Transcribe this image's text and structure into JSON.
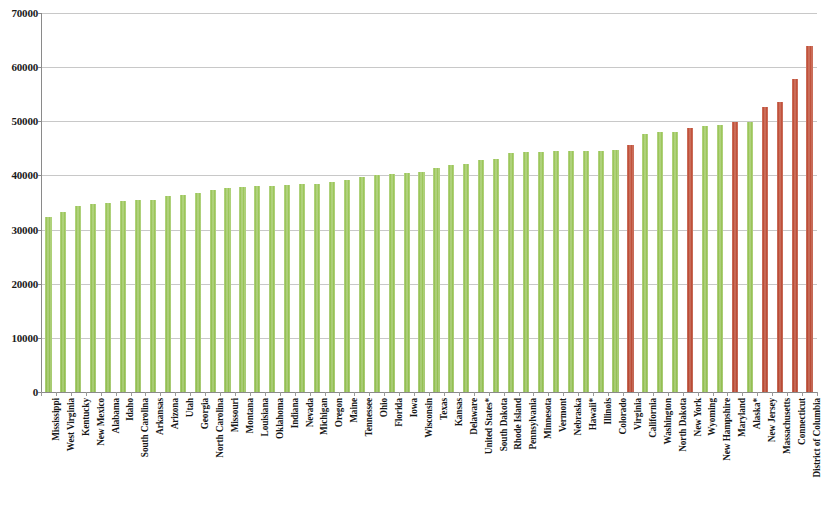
{
  "chart_data": {
    "type": "bar",
    "title": "",
    "subtitle": "",
    "xlabel": "",
    "ylabel": "",
    "ylim": [
      0,
      70000
    ],
    "y_ticks": [
      0,
      10000,
      20000,
      30000,
      40000,
      50000,
      60000,
      70000
    ],
    "grid": true,
    "legend": "none",
    "colors": {
      "default_bar": "#9dc75c",
      "highlight_bar": "#c2533c",
      "gridline": "#c8c8c8",
      "axis": "#8a8a8a",
      "text": "#161616",
      "background": "#ffffff"
    },
    "highlight_note": "Red bars mark highlighted jurisdictions; green bars are all others.",
    "categories": [
      "Mississippi",
      "West Virginia",
      "Kentucky",
      "New Mexico",
      "Alabama",
      "Idaho",
      "South Carolina",
      "Arkansas",
      "Arizona",
      "Utah",
      "Georgia",
      "North Carolina",
      "Missouri",
      "Montana",
      "Louisiana",
      "Oklahoma",
      "Indiana",
      "Nevada",
      "Michigan",
      "Oregon",
      "Maine",
      "Tennessee",
      "Ohio",
      "Florida",
      "Iowa",
      "Wisconsin",
      "Texas",
      "Kansas",
      "Delaware",
      "United States*",
      "South Dakota",
      "Rhode Island",
      "Pennsylvania",
      "Minnesota",
      "Vermont",
      "Nebraska",
      "Hawaii*",
      "Illinois",
      "Colorado",
      "Virginia",
      "California",
      "Washington",
      "North Dakota",
      "New York",
      "Wyoming",
      "New Hampshire",
      "Maryland",
      "Alaska*",
      "New Jersey",
      "Massachusetts",
      "Connecticut",
      "District of Columbia"
    ],
    "values": [
      32400,
      33200,
      34300,
      34800,
      35000,
      35200,
      35400,
      35500,
      36200,
      36300,
      36800,
      37400,
      37600,
      37800,
      38000,
      38100,
      38200,
      38400,
      38400,
      38800,
      39100,
      39700,
      40000,
      40300,
      40400,
      40700,
      41300,
      42000,
      42200,
      42800,
      43100,
      44100,
      44300,
      44400,
      44500,
      44500,
      44500,
      44500,
      44700,
      45700,
      47600,
      48000,
      48100,
      48800,
      49200,
      49300,
      49800,
      49900,
      52700,
      53500,
      57800,
      63900
    ],
    "highlighted": [
      "Virginia",
      "New York",
      "Maryland",
      "New Jersey",
      "Massachusetts",
      "Connecticut",
      "District of Columbia"
    ]
  }
}
